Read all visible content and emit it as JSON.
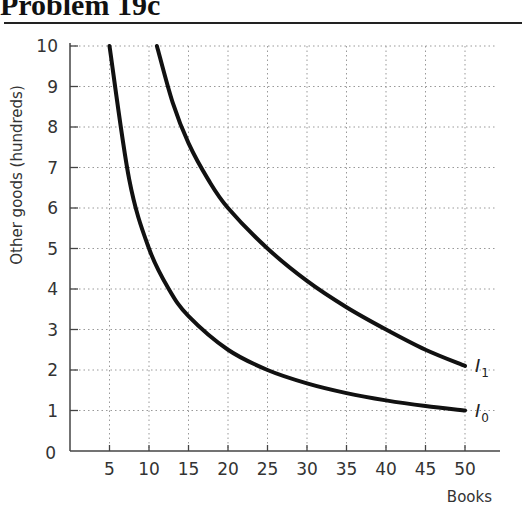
{
  "title": "Problem 19c",
  "chart_data": {
    "type": "line",
    "title": "Problem 19c",
    "xlabel": "Books",
    "ylabel": "Other goods (hundreds)",
    "xlim": [
      0,
      52
    ],
    "ylim": [
      0,
      10
    ],
    "x_ticks": [
      5,
      10,
      15,
      20,
      25,
      30,
      35,
      40,
      45,
      50
    ],
    "y_ticks": [
      0,
      1,
      2,
      3,
      4,
      5,
      6,
      7,
      8,
      9,
      10
    ],
    "origin_label": "0",
    "grid": true,
    "grid_style": "dotted",
    "legend": "inline curve labels",
    "series": [
      {
        "name": "I0",
        "label_main": "I",
        "label_sub": "0",
        "points": [
          [
            5,
            10
          ],
          [
            7.5,
            6.7
          ],
          [
            10,
            5.0
          ],
          [
            12.5,
            4.0
          ],
          [
            15,
            3.33
          ],
          [
            20,
            2.5
          ],
          [
            25,
            2.0
          ],
          [
            30,
            1.67
          ],
          [
            35,
            1.43
          ],
          [
            40,
            1.25
          ],
          [
            45,
            1.11
          ],
          [
            50,
            1.0
          ]
        ]
      },
      {
        "name": "I1",
        "label_main": "I",
        "label_sub": "1",
        "points": [
          [
            11,
            10
          ],
          [
            13,
            8.6
          ],
          [
            15,
            7.6
          ],
          [
            17.5,
            6.7
          ],
          [
            20,
            6.0
          ],
          [
            25,
            5.0
          ],
          [
            30,
            4.2
          ],
          [
            35,
            3.55
          ],
          [
            40,
            3.0
          ],
          [
            45,
            2.5
          ],
          [
            50,
            2.1
          ]
        ]
      }
    ]
  }
}
